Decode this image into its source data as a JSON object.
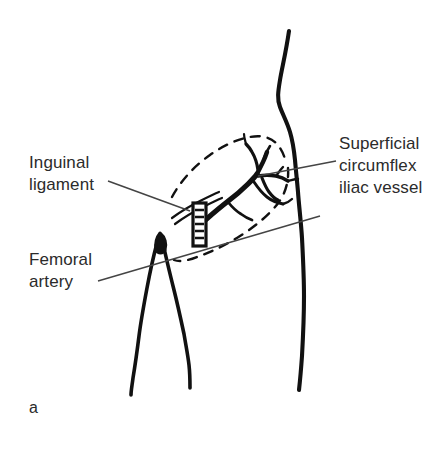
{
  "figure": {
    "panel_letter": "a",
    "background_color": "#ffffff",
    "ink_color": "#111111",
    "text_color": "#2b2b2b",
    "width": 447,
    "height": 453
  },
  "annotations": [
    {
      "id": "inguinal-ligament",
      "text": "Inguinal\nligament",
      "lines": [
        "Inguinal",
        "ligament"
      ],
      "leader_from": [
        152,
        182
      ],
      "leader_to": [
        205,
        210
      ]
    },
    {
      "id": "femoral-artery",
      "text": "Femoral\nartery",
      "lines": [
        "Femoral",
        "artery"
      ],
      "leader_from": [
        104,
        280
      ],
      "leader_to": [
        310,
        219
      ]
    },
    {
      "id": "superficial-circumflex-iliac-vessel",
      "text": "Superficial\ncircumflex\niliac vessel",
      "lines": [
        "Superficial",
        "circumflex",
        "iliac vessel"
      ],
      "leader_from": [
        336,
        164
      ],
      "leader_to": [
        261,
        177
      ]
    }
  ],
  "structures": [
    {
      "id": "torso-outline",
      "label": "torso and hip contour",
      "style": "solid"
    },
    {
      "id": "left-leg-outline",
      "label": "medial thigh contour",
      "style": "solid"
    },
    {
      "id": "right-leg-outline",
      "label": "lateral thigh contour",
      "style": "solid"
    },
    {
      "id": "flap-outline",
      "label": "flap harvest outline",
      "style": "dashed"
    },
    {
      "id": "vessel-tree",
      "label": "superficial circumflex iliac vessel tree",
      "style": "solid-filled"
    },
    {
      "id": "inguinal-ligament-band",
      "label": "inguinal ligament double line",
      "style": "solid"
    },
    {
      "id": "surgical-clip",
      "label": "surgical clip marker",
      "style": "solid-filled"
    },
    {
      "id": "femoral-artery-mark",
      "label": "femoral artery pulse mark",
      "style": "solid-filled"
    }
  ]
}
